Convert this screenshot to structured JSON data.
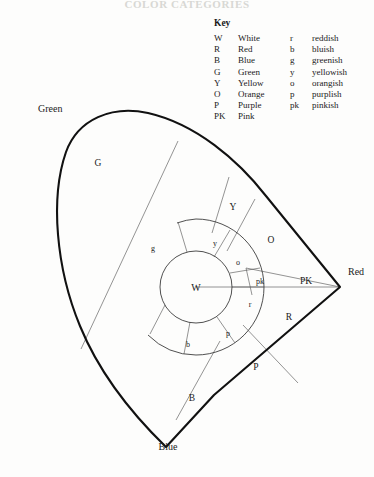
{
  "page": {
    "running_head": "COLOR CATEGORIES",
    "background_color": "#fdfdfc",
    "ink_color": "#1a1a1a"
  },
  "key": {
    "title": "Key",
    "rows": [
      {
        "abbr": "W",
        "name": "White",
        "abbr2": "r",
        "name2": "reddish"
      },
      {
        "abbr": "R",
        "name": "Red",
        "abbr2": "b",
        "name2": "bluish"
      },
      {
        "abbr": "B",
        "name": "Blue",
        "abbr2": "g",
        "name2": "greenish"
      },
      {
        "abbr": "G",
        "name": "Green",
        "abbr2": "y",
        "name2": "yellowish"
      },
      {
        "abbr": "Y",
        "name": "Yellow",
        "abbr2": "o",
        "name2": "orangish"
      },
      {
        "abbr": "O",
        "name": "Orange",
        "abbr2": "p",
        "name2": "purplish"
      },
      {
        "abbr": "P",
        "name": "Purple",
        "abbr2": "pk",
        "name2": "pinkish"
      },
      {
        "abbr": "PK",
        "name": "Pink",
        "abbr2": "",
        "name2": ""
      }
    ]
  },
  "diagram": {
    "type": "color-category-wedge",
    "center_label": "W",
    "corner_labels": [
      {
        "id": "green-corner",
        "text": "Green",
        "x": 38,
        "y": 112
      },
      {
        "id": "red-corner",
        "text": "Red",
        "x": 352,
        "y": 275
      },
      {
        "id": "blue-corner",
        "text": "Blue",
        "x": 168,
        "y": 447
      }
    ],
    "outer_regions": [
      {
        "id": "region-G",
        "text": "G",
        "x": 98,
        "y": 163
      },
      {
        "id": "region-Y",
        "text": "Y",
        "x": 233,
        "y": 207
      },
      {
        "id": "region-O",
        "text": "O",
        "x": 270,
        "y": 240
      },
      {
        "id": "region-PK",
        "text": "PK",
        "x": 306,
        "y": 281
      },
      {
        "id": "region-R",
        "text": "R",
        "x": 288,
        "y": 316
      },
      {
        "id": "region-P",
        "text": "P",
        "x": 255,
        "y": 366
      },
      {
        "id": "region-B",
        "text": "B",
        "x": 192,
        "y": 397
      }
    ],
    "inner_regions": [
      {
        "id": "ring-g",
        "text": "g",
        "x": 153,
        "y": 248
      },
      {
        "id": "ring-y",
        "text": "y",
        "x": 215,
        "y": 243
      },
      {
        "id": "ring-o",
        "text": "o",
        "x": 237,
        "y": 262
      },
      {
        "id": "ring-pk",
        "text": "pk",
        "x": 259,
        "y": 281
      },
      {
        "id": "ring-r",
        "text": "r",
        "x": 250,
        "y": 304
      },
      {
        "id": "ring-p",
        "text": "p",
        "x": 228,
        "y": 333
      },
      {
        "id": "ring-b",
        "text": "b",
        "x": 188,
        "y": 344
      }
    ],
    "geometry": {
      "center_x": 196,
      "center_y": 287,
      "white_radius": 36,
      "ring_radius": 68,
      "red_vertex_x": 340,
      "red_vertex_y": 287
    }
  }
}
